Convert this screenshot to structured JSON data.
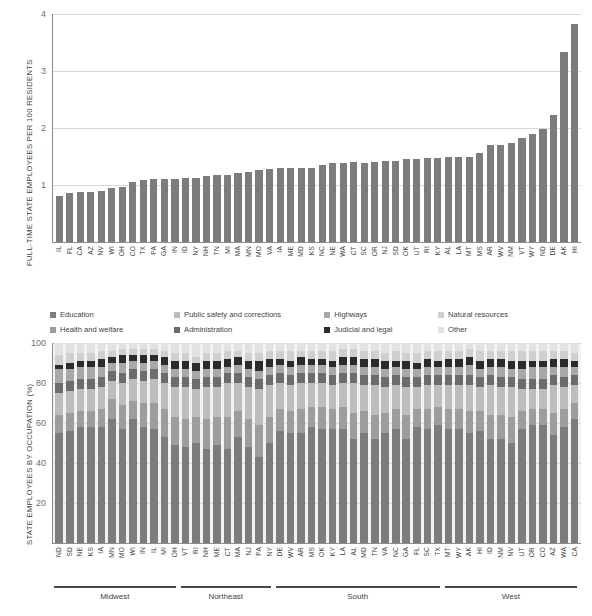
{
  "chart_data": [
    {
      "type": "bar",
      "title": "",
      "ylabel": "FULL-TIME STATE EMPLOYEES PER 100 RESIDENTS",
      "xlabel": "",
      "ylim": [
        0,
        4
      ],
      "yticks": [
        1,
        2,
        3,
        4
      ],
      "grid": true,
      "legend": "none",
      "bar_color": "#7c7c7c",
      "categories": [
        "IL",
        "FL",
        "CA",
        "AZ",
        "NV",
        "WI",
        "OH",
        "CO",
        "TX",
        "PA",
        "GA",
        "IN",
        "ID",
        "NY",
        "NH",
        "TN",
        "MI",
        "MA",
        "MN",
        "MO",
        "VA",
        "IA",
        "ME",
        "MD",
        "KS",
        "NC",
        "NE",
        "WA",
        "CT",
        "SC",
        "OR",
        "NJ",
        "SD",
        "OK",
        "UT",
        "RI",
        "KY",
        "AL",
        "LA",
        "MT",
        "MS",
        "AR",
        "WV",
        "NM",
        "VT",
        "WY",
        "ND",
        "DE",
        "AK",
        "HI"
      ],
      "values": [
        0.8,
        0.86,
        0.87,
        0.87,
        0.89,
        0.95,
        0.97,
        1.05,
        1.09,
        1.1,
        1.1,
        1.11,
        1.12,
        1.13,
        1.15,
        1.17,
        1.17,
        1.21,
        1.22,
        1.26,
        1.28,
        1.3,
        1.3,
        1.3,
        1.3,
        1.35,
        1.38,
        1.39,
        1.4,
        1.39,
        1.4,
        1.42,
        1.43,
        1.45,
        1.45,
        1.47,
        1.48,
        1.5,
        1.5,
        1.5,
        1.57,
        1.7,
        1.71,
        1.73,
        1.83,
        1.9,
        1.98,
        2.23,
        3.34,
        3.83
      ]
    },
    {
      "type": "bar",
      "subtype": "stacked-100",
      "title": "",
      "ylabel": "STATE EMPLOYEES BY OCCUPATION (%)",
      "xlabel": "",
      "ylim": [
        0,
        100
      ],
      "yticks": [
        20,
        40,
        60,
        80,
        100
      ],
      "grid": true,
      "legend_position": "above",
      "series": [
        {
          "name": "Education",
          "color": "#7c7c7c",
          "values": [
            55,
            56,
            58,
            58,
            58,
            62,
            57,
            62,
            58,
            57,
            53,
            49,
            48,
            50,
            47,
            49,
            47,
            53,
            48,
            43,
            50,
            56,
            55,
            55,
            58,
            57,
            57,
            57,
            52,
            55,
            52,
            55,
            57,
            52,
            58,
            57,
            59,
            57,
            57,
            55,
            56,
            52,
            52,
            50,
            57,
            59,
            59,
            54,
            58,
            62,
            47
          ]
        },
        {
          "name": "Health and welfare",
          "color": "#9d9d9d",
          "values": [
            9,
            9,
            8,
            8,
            9,
            10,
            12,
            9,
            12,
            13,
            14,
            14,
            14,
            13,
            15,
            14,
            16,
            13,
            14,
            16,
            13,
            11,
            11,
            12,
            10,
            11,
            10,
            11,
            13,
            11,
            12,
            10,
            10,
            12,
            9,
            10,
            9,
            10,
            10,
            11,
            10,
            12,
            12,
            13,
            9,
            8,
            8,
            11,
            9,
            8,
            13
          ]
        },
        {
          "name": "Public safety and corrections",
          "color": "#bdbdbd",
          "values": [
            11,
            11,
            11,
            11,
            11,
            9,
            11,
            11,
            11,
            12,
            13,
            15,
            16,
            14,
            16,
            15,
            17,
            14,
            16,
            18,
            16,
            13,
            13,
            13,
            12,
            12,
            12,
            12,
            15,
            13,
            15,
            13,
            12,
            14,
            11,
            12,
            11,
            12,
            12,
            13,
            12,
            15,
            14,
            15,
            11,
            10,
            10,
            14,
            11,
            9,
            16
          ]
        },
        {
          "name": "Administration",
          "color": "#6c6c6c",
          "values": [
            5,
            5,
            5,
            5,
            5,
            5,
            5,
            5,
            5,
            5,
            5,
            5,
            5,
            5,
            5,
            5,
            5,
            5,
            5,
            5,
            5,
            5,
            5,
            5,
            5,
            5,
            5,
            5,
            5,
            5,
            5,
            5,
            5,
            5,
            5,
            5,
            5,
            5,
            5,
            5,
            5,
            5,
            5,
            5,
            5,
            5,
            5,
            5,
            5,
            5,
            5
          ]
        },
        {
          "name": "Highways",
          "color": "#a8a8a8",
          "values": [
            7,
            6,
            6,
            6,
            5,
            4,
            5,
            4,
            4,
            4,
            4,
            4,
            4,
            4,
            4,
            4,
            3,
            4,
            4,
            4,
            4,
            4,
            4,
            4,
            4,
            4,
            4,
            4,
            4,
            4,
            4,
            4,
            4,
            4,
            4,
            4,
            4,
            4,
            4,
            5,
            4,
            4,
            5,
            4,
            5,
            6,
            6,
            4,
            5,
            4,
            4
          ]
        },
        {
          "name": "Judicial and legal",
          "color": "#2b2b2b",
          "values": [
            2,
            3,
            3,
            3,
            4,
            3,
            4,
            3,
            4,
            3,
            4,
            4,
            4,
            4,
            4,
            4,
            4,
            4,
            4,
            5,
            4,
            3,
            3,
            4,
            3,
            3,
            3,
            4,
            4,
            4,
            4,
            4,
            3,
            4,
            3,
            4,
            3,
            4,
            4,
            4,
            4,
            4,
            4,
            4,
            4,
            3,
            3,
            4,
            4,
            3,
            5
          ]
        },
        {
          "name": "Natural resources",
          "color": "#cfcfcf",
          "values": [
            5,
            5,
            4,
            4,
            4,
            3,
            3,
            3,
            3,
            3,
            3,
            4,
            4,
            3,
            4,
            4,
            4,
            3,
            4,
            4,
            4,
            4,
            5,
            3,
            4,
            4,
            5,
            4,
            4,
            4,
            4,
            4,
            5,
            4,
            5,
            4,
            5,
            4,
            4,
            4,
            5,
            4,
            4,
            5,
            5,
            5,
            5,
            4,
            4,
            4,
            5
          ]
        },
        {
          "name": "Other",
          "color": "#e2e2e2",
          "values": [
            6,
            5,
            5,
            5,
            4,
            4,
            3,
            3,
            3,
            3,
            4,
            5,
            5,
            7,
            5,
            5,
            4,
            4,
            5,
            5,
            4,
            4,
            4,
            4,
            4,
            4,
            4,
            3,
            3,
            4,
            4,
            5,
            4,
            5,
            5,
            4,
            4,
            4,
            4,
            3,
            4,
            4,
            4,
            4,
            4,
            4,
            4,
            4,
            4,
            5,
            5
          ]
        }
      ],
      "categories": [
        "ND",
        "SD",
        "NE",
        "KS",
        "IA",
        "MN",
        "MO",
        "WI",
        "IN",
        "IL",
        "MI",
        "OH",
        "VT",
        "RI",
        "NH",
        "ME",
        "CT",
        "MA",
        "NJ",
        "PA",
        "NY",
        "DE",
        "WV",
        "AR",
        "MS",
        "OK",
        "KY",
        "LA",
        "AL",
        "MD",
        "TN",
        "VA",
        "NC",
        "GA",
        "FL",
        "SC",
        "TX",
        "MT",
        "WY",
        "AK",
        "HI",
        "ID",
        "NM",
        "NV",
        "UT",
        "OR",
        "CO",
        "AZ",
        "WA",
        "CA"
      ],
      "regions": [
        {
          "name": "Midwest",
          "start": 0,
          "count": 12
        },
        {
          "name": "Northeast",
          "start": 12,
          "count": 9
        },
        {
          "name": "South",
          "start": 21,
          "count": 16
        },
        {
          "name": "West",
          "start": 37,
          "count": 13
        }
      ]
    }
  ],
  "top": {
    "ylabel": "FULL-TIME STATE EMPLOYEES PER 100 RESIDENTS",
    "yticks": [
      "4",
      "3",
      "2",
      "1"
    ]
  },
  "legend": {
    "rows": [
      [
        {
          "label": "Education",
          "color": "#7c7c7c"
        },
        {
          "label": "Public safety and corrections",
          "color": "#bdbdbd"
        },
        {
          "label": "Highways",
          "color": "#a8a8a8"
        },
        {
          "label": "Natural resources",
          "color": "#cfcfcf"
        }
      ],
      [
        {
          "label": "Health and welfare",
          "color": "#9d9d9d"
        },
        {
          "label": "Administration",
          "color": "#6c6c6c"
        },
        {
          "label": "Judicial and legal",
          "color": "#2b2b2b"
        },
        {
          "label": "Other",
          "color": "#e2e2e2"
        }
      ]
    ]
  },
  "bottom": {
    "ylabel": "STATE EMPLOYEES BY OCCUPATION (%)",
    "yticks": [
      "100",
      "80",
      "60",
      "40",
      "20"
    ]
  }
}
